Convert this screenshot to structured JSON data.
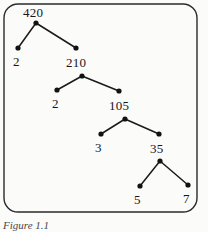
{
  "figure": {
    "caption": "Figure 1.1",
    "border": {
      "shape": "rounded-rectangle",
      "stroke_color": "#2b2b2e",
      "stroke_width": 1.4,
      "corner_radius": 14,
      "x": 4,
      "y": 4,
      "width": 193,
      "height": 208
    },
    "style": {
      "dot_color": "#121214",
      "edge_color": "#1a1a1d",
      "dot_radius": 2.6,
      "edge_width": 1.5,
      "background": "#fbfbfa",
      "text_color": "#16161a"
    }
  },
  "tree": {
    "type": "factor-tree",
    "root_value": "420",
    "nodes": [
      {
        "id": "n420",
        "label": "420",
        "dot_x": 36,
        "dot_y": 23,
        "label_x": 23,
        "label_y": 6
      },
      {
        "id": "n2a",
        "label": "2",
        "dot_x": 18,
        "dot_y": 48,
        "label_x": 13,
        "label_y": 55
      },
      {
        "id": "n210",
        "label": "210",
        "dot_x": 76,
        "dot_y": 48,
        "label_x": 66,
        "label_y": 56
      },
      {
        "id": "n210b",
        "label": "",
        "dot_x": 82,
        "dot_y": 76,
        "label_x": 0,
        "label_y": 0
      },
      {
        "id": "n2b",
        "label": "2",
        "dot_x": 57,
        "dot_y": 90,
        "label_x": 52,
        "label_y": 97
      },
      {
        "id": "n105",
        "label": "105",
        "dot_x": 119,
        "dot_y": 91,
        "label_x": 109,
        "label_y": 99
      },
      {
        "id": "n105b",
        "label": "",
        "dot_x": 125,
        "dot_y": 119,
        "label_x": 0,
        "label_y": 0
      },
      {
        "id": "n3",
        "label": "3",
        "dot_x": 101,
        "dot_y": 134,
        "label_x": 95,
        "label_y": 141
      },
      {
        "id": "n35",
        "label": "35",
        "dot_x": 159,
        "dot_y": 134,
        "label_x": 150,
        "label_y": 142
      },
      {
        "id": "n35b",
        "label": "",
        "dot_x": 160,
        "dot_y": 161,
        "label_x": 0,
        "label_y": 0
      },
      {
        "id": "n5",
        "label": "5",
        "dot_x": 140,
        "dot_y": 186,
        "label_x": 134,
        "label_y": 193
      },
      {
        "id": "n7",
        "label": "7",
        "dot_x": 188,
        "dot_y": 185,
        "label_x": 183,
        "label_y": 192
      }
    ],
    "edges": [
      {
        "from": "n420",
        "to": "n2a",
        "x1": 36,
        "y1": 23,
        "x2": 18,
        "y2": 48
      },
      {
        "from": "n420",
        "to": "n210",
        "x1": 36,
        "y1": 23,
        "x2": 76,
        "y2": 48
      },
      {
        "from": "n210b",
        "to": "n2b",
        "x1": 82,
        "y1": 76,
        "x2": 57,
        "y2": 90
      },
      {
        "from": "n210b",
        "to": "n105",
        "x1": 82,
        "y1": 76,
        "x2": 119,
        "y2": 91
      },
      {
        "from": "n105b",
        "to": "n3",
        "x1": 125,
        "y1": 119,
        "x2": 101,
        "y2": 134
      },
      {
        "from": "n105b",
        "to": "n35",
        "x1": 125,
        "y1": 119,
        "x2": 159,
        "y2": 134
      },
      {
        "from": "n35b",
        "to": "n5",
        "x1": 160,
        "y1": 161,
        "x2": 140,
        "y2": 186
      },
      {
        "from": "n35b",
        "to": "n7",
        "x1": 160,
        "y1": 161,
        "x2": 188,
        "y2": 185
      }
    ]
  }
}
